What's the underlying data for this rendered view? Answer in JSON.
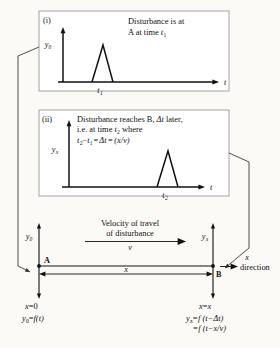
{
  "figure": {
    "title_semantic": "wave-propagation-disturbance-diagram",
    "background_color": "#fbfaf7",
    "ink_color": "#111111",
    "panel_border_color": "#8e8e8e"
  },
  "panel_i": {
    "number": "(i)",
    "caption_line1": "Disturbance is at",
    "caption_line2_a": "A at time ",
    "caption_line2_b": "t",
    "caption_line2_sub": "1",
    "y_axis_label": "y",
    "y_axis_sub": "0",
    "x_axis_label": "t",
    "pulse_tick_label": "t",
    "pulse_tick_sub": "1"
  },
  "panel_ii": {
    "number": "(ii)",
    "caption_line1_a": "Disturbance reaches B, ",
    "caption_line1_b": "Δt",
    "caption_line1_c": " later,",
    "caption_line2_a": "i.e. at time ",
    "caption_line2_b": "t",
    "caption_line2_sub": "2",
    "caption_line2_c": " where",
    "equation_t2": "t",
    "equation_t2_sub": "2",
    "equation_minus": "−",
    "equation_t1": "t",
    "equation_t1_sub": "1",
    "equation_eq1": "=",
    "equation_dt": "Δt",
    "equation_eq2": "=",
    "equation_rhs": "(x/v)",
    "y_axis_label": "y",
    "y_axis_sub": "x",
    "x_axis_label": "t",
    "pulse_tick_label": "t",
    "pulse_tick_sub": "2"
  },
  "lower_diagram": {
    "velocity_caption_line1": "Velocity of travel",
    "velocity_caption_line2": "of disturbance",
    "velocity_symbol": "v",
    "point_a_label": "A",
    "point_b_label": "B",
    "distance_label": "x",
    "y_left_label": "y",
    "y_left_sub": "0",
    "y_right_label": "y",
    "y_right_sub": "x",
    "direction_label_top": "x",
    "direction_label_bottom": "direction",
    "left_eq_1_a": "x",
    "left_eq_1_b": "=",
    "left_eq_1_c": "0",
    "left_eq_2_a": "y",
    "left_eq_2_sub": "0",
    "left_eq_2_b": "=",
    "left_eq_2_c": "f(t)",
    "right_eq_1_a": "x",
    "right_eq_1_b": "=",
    "right_eq_1_c": "x",
    "right_eq_2_a": "y",
    "right_eq_2_sub": "x",
    "right_eq_2_b": "=",
    "right_eq_2_c": "f (t−Δt)",
    "right_eq_3_a": "=",
    "right_eq_3_b": "f (t−x/v)"
  }
}
